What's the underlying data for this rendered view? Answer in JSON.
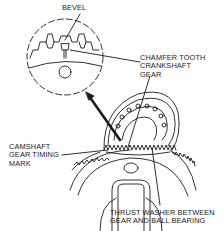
{
  "diagram": {
    "type": "technical-illustration",
    "stroke_color": "#1a1a1a",
    "background": "#ffffff",
    "labels": {
      "bevel": "BEVEL",
      "chamfer_tooth": "CHAMFER TOOTH\nCRANKSHAFT\nGEAR",
      "camshaft_timing_mark": "CAMSHAFT\nGEAR TIMING\nMARK",
      "thrust_washer": "THRUST WASHER BETWEEN\nGEAR AND BALL BEARING"
    },
    "components": [
      "detail-inset-circle",
      "crankshaft-gear",
      "ball-bearing",
      "camshaft-gear",
      "camshaft-hub",
      "leader-lines"
    ]
  }
}
